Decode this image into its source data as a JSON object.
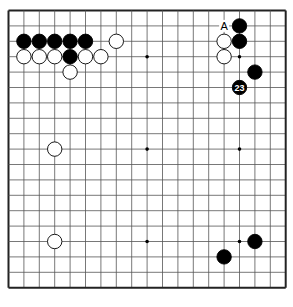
{
  "board": {
    "size": 19,
    "origin_x": 8.5,
    "origin_y": 10.5,
    "spacing": 15.4,
    "line_color": "#555555",
    "border_color": "#222222",
    "star_points": [
      [
        3,
        3
      ],
      [
        3,
        9
      ],
      [
        3,
        15
      ],
      [
        9,
        3
      ],
      [
        9,
        9
      ],
      [
        9,
        15
      ],
      [
        15,
        3
      ],
      [
        15,
        9
      ],
      [
        15,
        15
      ]
    ]
  },
  "stones": [
    {
      "color": "black",
      "col": 1,
      "row": 2
    },
    {
      "color": "black",
      "col": 2,
      "row": 2
    },
    {
      "color": "black",
      "col": 3,
      "row": 2
    },
    {
      "color": "black",
      "col": 4,
      "row": 2
    },
    {
      "color": "black",
      "col": 5,
      "row": 2
    },
    {
      "color": "white",
      "col": 7,
      "row": 2
    },
    {
      "color": "white",
      "col": 1,
      "row": 3
    },
    {
      "color": "white",
      "col": 2,
      "row": 3
    },
    {
      "color": "white",
      "col": 3,
      "row": 3
    },
    {
      "color": "black",
      "col": 4,
      "row": 3
    },
    {
      "color": "white",
      "col": 5,
      "row": 3
    },
    {
      "color": "white",
      "col": 6,
      "row": 3
    },
    {
      "color": "white",
      "col": 4,
      "row": 4
    },
    {
      "color": "black",
      "col": 15,
      "row": 1
    },
    {
      "color": "black",
      "col": 15,
      "row": 2
    },
    {
      "color": "white",
      "col": 14,
      "row": 2
    },
    {
      "color": "white",
      "col": 14,
      "row": 3
    },
    {
      "color": "black",
      "col": 16,
      "row": 4
    },
    {
      "color": "black",
      "col": 15,
      "row": 5,
      "label": "23"
    },
    {
      "color": "white",
      "col": 3,
      "row": 9
    },
    {
      "color": "white",
      "col": 3,
      "row": 15
    },
    {
      "color": "black",
      "col": 16,
      "row": 15
    },
    {
      "color": "black",
      "col": 14,
      "row": 16
    }
  ],
  "markers": [
    {
      "text": "A",
      "col": 14,
      "row": 1
    }
  ]
}
